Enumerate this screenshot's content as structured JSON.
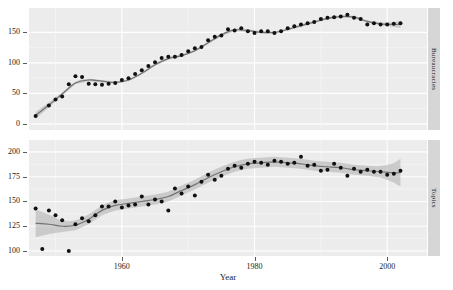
{
  "figure": {
    "width": 453,
    "height": 290,
    "background": "#ffffff",
    "panel_fill": "#ececec",
    "strip_fill": "#d6d6d6",
    "point_color": "#111111",
    "line_color": "#737373",
    "band_color": "#aeaeae"
  },
  "axis": {
    "x_title": "Year",
    "x_ticks": [
      1960,
      1980,
      2000
    ],
    "x_tick_labels": [
      "1960",
      "1980",
      "2000"
    ],
    "x_limits": [
      1946,
      2006
    ]
  },
  "panels": [
    {
      "strip_label": "Bureaucracies",
      "y_ticks": [
        0,
        50,
        100,
        150
      ],
      "y_tick_labels": [
        "0",
        "50",
        "100",
        "150"
      ],
      "y_limits": [
        -10,
        190
      ]
    },
    {
      "strip_label": "Topics",
      "y_ticks": [
        100,
        125,
        150,
        175,
        200
      ],
      "y_tick_labels": [
        "100",
        "125",
        "150",
        "175",
        "200"
      ],
      "y_limits": [
        95,
        212
      ]
    }
  ],
  "chart_data": {
    "type": "scatter",
    "title": "",
    "xlabel": "Year",
    "ylabel": "",
    "grid": true,
    "legend_position": "none",
    "facet_strip_position": "right",
    "smoother": "loess with confidence band",
    "panels": [
      {
        "name": "Bureaucracies",
        "ylabel": "Bureaucracies",
        "ylim": [
          -10,
          190
        ],
        "yticks": [
          0,
          50,
          100,
          150
        ],
        "xlim": [
          1946,
          2006
        ],
        "points": [
          {
            "x": 1947,
            "y": 13
          },
          {
            "x": 1949,
            "y": 30
          },
          {
            "x": 1950,
            "y": 40
          },
          {
            "x": 1951,
            "y": 45
          },
          {
            "x": 1952,
            "y": 65
          },
          {
            "x": 1953,
            "y": 78
          },
          {
            "x": 1954,
            "y": 77
          },
          {
            "x": 1955,
            "y": 66
          },
          {
            "x": 1956,
            "y": 65
          },
          {
            "x": 1957,
            "y": 64
          },
          {
            "x": 1958,
            "y": 66
          },
          {
            "x": 1959,
            "y": 67
          },
          {
            "x": 1960,
            "y": 72
          },
          {
            "x": 1961,
            "y": 75
          },
          {
            "x": 1962,
            "y": 82
          },
          {
            "x": 1963,
            "y": 88
          },
          {
            "x": 1964,
            "y": 95
          },
          {
            "x": 1965,
            "y": 101
          },
          {
            "x": 1966,
            "y": 108
          },
          {
            "x": 1967,
            "y": 110
          },
          {
            "x": 1968,
            "y": 110
          },
          {
            "x": 1969,
            "y": 113
          },
          {
            "x": 1970,
            "y": 119
          },
          {
            "x": 1971,
            "y": 124
          },
          {
            "x": 1972,
            "y": 126
          },
          {
            "x": 1973,
            "y": 137
          },
          {
            "x": 1974,
            "y": 143
          },
          {
            "x": 1975,
            "y": 145
          },
          {
            "x": 1976,
            "y": 155
          },
          {
            "x": 1977,
            "y": 153
          },
          {
            "x": 1978,
            "y": 157
          },
          {
            "x": 1979,
            "y": 152
          },
          {
            "x": 1980,
            "y": 149
          },
          {
            "x": 1981,
            "y": 152
          },
          {
            "x": 1982,
            "y": 152
          },
          {
            "x": 1983,
            "y": 149
          },
          {
            "x": 1984,
            "y": 152
          },
          {
            "x": 1985,
            "y": 157
          },
          {
            "x": 1986,
            "y": 160
          },
          {
            "x": 1987,
            "y": 163
          },
          {
            "x": 1988,
            "y": 165
          },
          {
            "x": 1989,
            "y": 167
          },
          {
            "x": 1990,
            "y": 172
          },
          {
            "x": 1991,
            "y": 174
          },
          {
            "x": 1992,
            "y": 175
          },
          {
            "x": 1993,
            "y": 176
          },
          {
            "x": 1994,
            "y": 179
          },
          {
            "x": 1995,
            "y": 174
          },
          {
            "x": 1996,
            "y": 172
          },
          {
            "x": 1997,
            "y": 163
          },
          {
            "x": 1998,
            "y": 165
          },
          {
            "x": 1999,
            "y": 163
          },
          {
            "x": 2000,
            "y": 163
          },
          {
            "x": 2001,
            "y": 164
          },
          {
            "x": 2002,
            "y": 165
          }
        ],
        "fit": [
          {
            "x": 1947,
            "y": 14
          },
          {
            "x": 1949,
            "y": 31
          },
          {
            "x": 1951,
            "y": 49
          },
          {
            "x": 1953,
            "y": 67
          },
          {
            "x": 1955,
            "y": 72
          },
          {
            "x": 1957,
            "y": 70
          },
          {
            "x": 1959,
            "y": 68
          },
          {
            "x": 1961,
            "y": 72
          },
          {
            "x": 1963,
            "y": 83
          },
          {
            "x": 1965,
            "y": 97
          },
          {
            "x": 1967,
            "y": 107
          },
          {
            "x": 1969,
            "y": 112
          },
          {
            "x": 1971,
            "y": 120
          },
          {
            "x": 1973,
            "y": 133
          },
          {
            "x": 1975,
            "y": 146
          },
          {
            "x": 1977,
            "y": 154
          },
          {
            "x": 1979,
            "y": 153
          },
          {
            "x": 1981,
            "y": 150
          },
          {
            "x": 1983,
            "y": 150
          },
          {
            "x": 1985,
            "y": 155
          },
          {
            "x": 1987,
            "y": 161
          },
          {
            "x": 1989,
            "y": 167
          },
          {
            "x": 1991,
            "y": 173
          },
          {
            "x": 1993,
            "y": 176
          },
          {
            "x": 1995,
            "y": 175
          },
          {
            "x": 1997,
            "y": 168
          },
          {
            "x": 1999,
            "y": 164
          },
          {
            "x": 2001,
            "y": 163
          },
          {
            "x": 2002,
            "y": 163
          }
        ],
        "band_halfwidth": 2
      },
      {
        "name": "Topics",
        "ylabel": "Topics",
        "ylim": [
          95,
          212
        ],
        "yticks": [
          100,
          125,
          150,
          175,
          200
        ],
        "xlim": [
          1946,
          2006
        ],
        "points": [
          {
            "x": 1947,
            "y": 143
          },
          {
            "x": 1948,
            "y": 102
          },
          {
            "x": 1949,
            "y": 141
          },
          {
            "x": 1950,
            "y": 136
          },
          {
            "x": 1951,
            "y": 131
          },
          {
            "x": 1952,
            "y": 100
          },
          {
            "x": 1953,
            "y": 127
          },
          {
            "x": 1954,
            "y": 133
          },
          {
            "x": 1955,
            "y": 130
          },
          {
            "x": 1956,
            "y": 136
          },
          {
            "x": 1957,
            "y": 145
          },
          {
            "x": 1958,
            "y": 145
          },
          {
            "x": 1959,
            "y": 150
          },
          {
            "x": 1960,
            "y": 144
          },
          {
            "x": 1961,
            "y": 146
          },
          {
            "x": 1962,
            "y": 147
          },
          {
            "x": 1963,
            "y": 155
          },
          {
            "x": 1964,
            "y": 147
          },
          {
            "x": 1965,
            "y": 152
          },
          {
            "x": 1966,
            "y": 150
          },
          {
            "x": 1967,
            "y": 141
          },
          {
            "x": 1968,
            "y": 163
          },
          {
            "x": 1969,
            "y": 158
          },
          {
            "x": 1970,
            "y": 165
          },
          {
            "x": 1971,
            "y": 156
          },
          {
            "x": 1972,
            "y": 170
          },
          {
            "x": 1973,
            "y": 177
          },
          {
            "x": 1974,
            "y": 172
          },
          {
            "x": 1975,
            "y": 176
          },
          {
            "x": 1976,
            "y": 183
          },
          {
            "x": 1977,
            "y": 186
          },
          {
            "x": 1978,
            "y": 184
          },
          {
            "x": 1979,
            "y": 188
          },
          {
            "x": 1980,
            "y": 190
          },
          {
            "x": 1981,
            "y": 189
          },
          {
            "x": 1982,
            "y": 187
          },
          {
            "x": 1983,
            "y": 191
          },
          {
            "x": 1984,
            "y": 190
          },
          {
            "x": 1985,
            "y": 188
          },
          {
            "x": 1986,
            "y": 189
          },
          {
            "x": 1987,
            "y": 195
          },
          {
            "x": 1988,
            "y": 186
          },
          {
            "x": 1989,
            "y": 187
          },
          {
            "x": 1990,
            "y": 181
          },
          {
            "x": 1991,
            "y": 182
          },
          {
            "x": 1992,
            "y": 188
          },
          {
            "x": 1993,
            "y": 184
          },
          {
            "x": 1994,
            "y": 176
          },
          {
            "x": 1995,
            "y": 183
          },
          {
            "x": 1996,
            "y": 180
          },
          {
            "x": 1997,
            "y": 182
          },
          {
            "x": 1998,
            "y": 180
          },
          {
            "x": 1999,
            "y": 180
          },
          {
            "x": 2000,
            "y": 177
          },
          {
            "x": 2001,
            "y": 178
          },
          {
            "x": 2002,
            "y": 181
          }
        ],
        "fit": [
          {
            "x": 1947,
            "y": 128
          },
          {
            "x": 1949,
            "y": 127
          },
          {
            "x": 1951,
            "y": 125
          },
          {
            "x": 1953,
            "y": 126
          },
          {
            "x": 1955,
            "y": 132
          },
          {
            "x": 1957,
            "y": 141
          },
          {
            "x": 1959,
            "y": 146
          },
          {
            "x": 1961,
            "y": 148
          },
          {
            "x": 1963,
            "y": 150
          },
          {
            "x": 1965,
            "y": 152
          },
          {
            "x": 1967,
            "y": 155
          },
          {
            "x": 1969,
            "y": 161
          },
          {
            "x": 1971,
            "y": 167
          },
          {
            "x": 1973,
            "y": 174
          },
          {
            "x": 1975,
            "y": 180
          },
          {
            "x": 1977,
            "y": 185
          },
          {
            "x": 1979,
            "y": 188
          },
          {
            "x": 1981,
            "y": 189
          },
          {
            "x": 1983,
            "y": 190
          },
          {
            "x": 1985,
            "y": 189
          },
          {
            "x": 1987,
            "y": 188
          },
          {
            "x": 1989,
            "y": 186
          },
          {
            "x": 1991,
            "y": 185
          },
          {
            "x": 1993,
            "y": 184
          },
          {
            "x": 1995,
            "y": 182
          },
          {
            "x": 1997,
            "y": 181
          },
          {
            "x": 1999,
            "y": 180
          },
          {
            "x": 2001,
            "y": 179
          },
          {
            "x": 2002,
            "y": 179
          }
        ],
        "band_halfwidth": 5
      }
    ]
  }
}
